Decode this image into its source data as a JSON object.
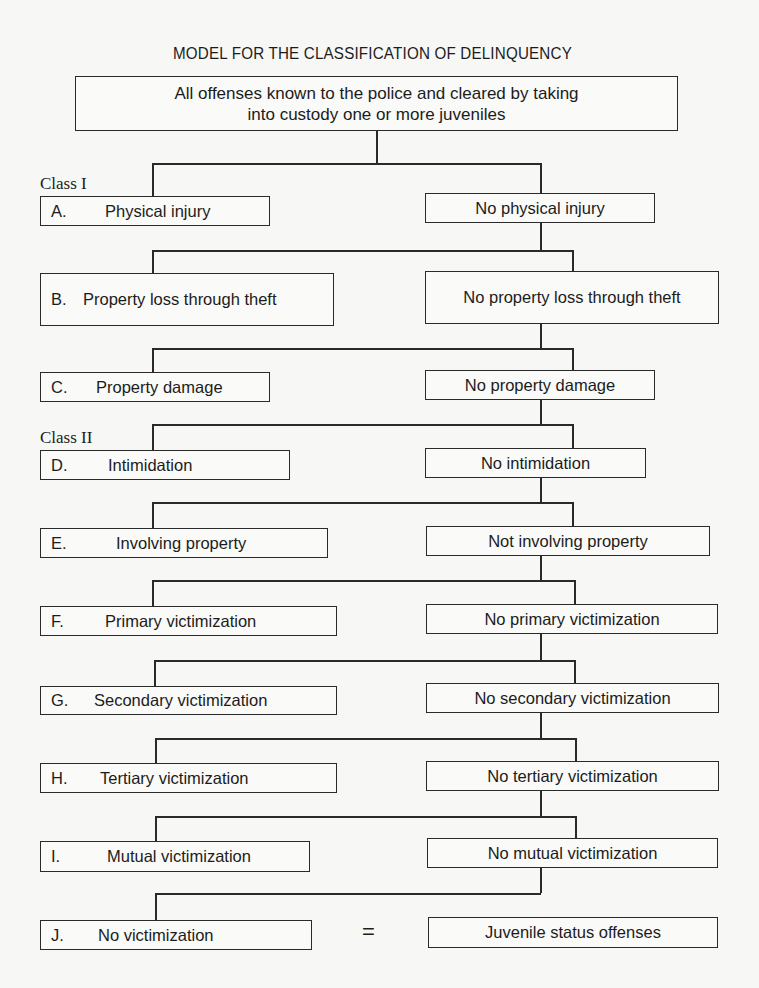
{
  "title": "MODEL FOR THE CLASSIFICATION OF DELINQUENCY",
  "root": {
    "line1": "All offenses known to the police and cleared by taking",
    "line2": "into custody one or more juveniles"
  },
  "class_labels": {
    "class1": "Class I",
    "class2": "Class II"
  },
  "levels": [
    {
      "letter": "A.",
      "left": "Physical injury",
      "right": "No physical injury"
    },
    {
      "letter": "B.",
      "left": "Property loss through theft",
      "right": "No property loss through theft"
    },
    {
      "letter": "C.",
      "left": "Property damage",
      "right": "No property damage"
    },
    {
      "letter": "D.",
      "left": "Intimidation",
      "right": "No intimidation"
    },
    {
      "letter": "E.",
      "left": "Involving property",
      "right": "Not involving property"
    },
    {
      "letter": "F.",
      "left": "Primary victimization",
      "right": "No primary victimization"
    },
    {
      "letter": "G.",
      "left": "Secondary victimization",
      "right": "No secondary victimization"
    },
    {
      "letter": "H.",
      "left": "Tertiary victimization",
      "right": "No tertiary victimization"
    },
    {
      "letter": "I.",
      "left": "Mutual victimization",
      "right": "No mutual victimization"
    },
    {
      "letter": "J.",
      "left": "No victimization",
      "right": "Juvenile status offenses"
    }
  ],
  "equals_sign": "="
}
